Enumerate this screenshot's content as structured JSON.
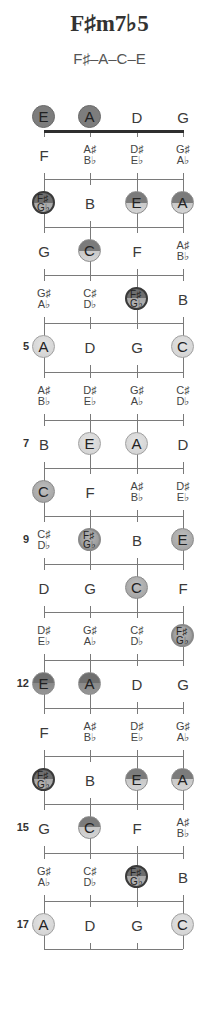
{
  "chord": {
    "name": "F♯m7♭5",
    "notes": "F♯–A–C–E"
  },
  "strings": [
    "E",
    "A",
    "D",
    "G"
  ],
  "chord_tones": [
    "F♯",
    "A",
    "C",
    "E"
  ],
  "open": [
    {
      "label": "E",
      "style": "dark"
    },
    {
      "label": "A",
      "style": "dark"
    },
    {
      "label": "D",
      "style": "plain"
    },
    {
      "label": "G",
      "style": "plain"
    }
  ],
  "fret_markers": [
    {
      "fret": 5,
      "label": "5"
    },
    {
      "fret": 7,
      "label": "7"
    },
    {
      "fret": 9,
      "label": "9"
    },
    {
      "fret": 12,
      "label": "12"
    },
    {
      "fret": 15,
      "label": "15"
    },
    {
      "fret": 17,
      "label": "17"
    }
  ],
  "frets": [
    {
      "fret": 1,
      "cells": [
        {
          "t": "F"
        },
        {
          "t": "A♯",
          "b": "B♭"
        },
        {
          "t": "D♯",
          "b": "E♭"
        },
        {
          "t": "G♯",
          "b": "A♭"
        }
      ]
    },
    {
      "fret": 2,
      "cells": [
        {
          "t": "F♯",
          "b": "G♭",
          "style": "root"
        },
        {
          "t": "B"
        },
        {
          "t": "E",
          "style": "split"
        },
        {
          "t": "A",
          "style": "split"
        }
      ]
    },
    {
      "fret": 3,
      "cells": [
        {
          "t": "G"
        },
        {
          "t": "C",
          "style": "split"
        },
        {
          "t": "F"
        },
        {
          "t": "A♯",
          "b": "B♭"
        }
      ]
    },
    {
      "fret": 4,
      "cells": [
        {
          "t": "G♯",
          "b": "A♭"
        },
        {
          "t": "C♯",
          "b": "D♭"
        },
        {
          "t": "F♯",
          "b": "G♭",
          "style": "root"
        },
        {
          "t": "B"
        }
      ]
    },
    {
      "fret": 5,
      "cells": [
        {
          "t": "A",
          "style": "light"
        },
        {
          "t": "D"
        },
        {
          "t": "G"
        },
        {
          "t": "C",
          "style": "light"
        }
      ]
    },
    {
      "fret": 6,
      "cells": [
        {
          "t": "A♯",
          "b": "B♭"
        },
        {
          "t": "D♯",
          "b": "E♭"
        },
        {
          "t": "G♯",
          "b": "A♭"
        },
        {
          "t": "C♯",
          "b": "D♭"
        }
      ]
    },
    {
      "fret": 7,
      "cells": [
        {
          "t": "B"
        },
        {
          "t": "E",
          "style": "light"
        },
        {
          "t": "A",
          "style": "light"
        },
        {
          "t": "D"
        }
      ]
    },
    {
      "fret": 8,
      "cells": [
        {
          "t": "C",
          "style": "mid"
        },
        {
          "t": "F"
        },
        {
          "t": "A♯",
          "b": "B♭"
        },
        {
          "t": "D♯",
          "b": "E♭"
        }
      ]
    },
    {
      "fret": 9,
      "cells": [
        {
          "t": "C♯",
          "b": "D♭"
        },
        {
          "t": "F♯",
          "b": "G♭",
          "style": "root mid"
        },
        {
          "t": "B"
        },
        {
          "t": "E",
          "style": "mid"
        }
      ]
    },
    {
      "fret": 10,
      "cells": [
        {
          "t": "D"
        },
        {
          "t": "G"
        },
        {
          "t": "C",
          "style": "mid"
        },
        {
          "t": "F"
        }
      ]
    },
    {
      "fret": 11,
      "cells": [
        {
          "t": "D♯",
          "b": "E♭"
        },
        {
          "t": "G♯",
          "b": "A♭"
        },
        {
          "t": "C♯",
          "b": "D♭"
        },
        {
          "t": "F♯",
          "b": "G♭",
          "style": "root mid"
        }
      ]
    },
    {
      "fret": 12,
      "cells": [
        {
          "t": "E",
          "style": "dk12"
        },
        {
          "t": "A",
          "style": "dk12"
        },
        {
          "t": "D"
        },
        {
          "t": "G"
        }
      ]
    },
    {
      "fret": 13,
      "cells": [
        {
          "t": "F"
        },
        {
          "t": "A♯",
          "b": "B♭"
        },
        {
          "t": "D♯",
          "b": "E♭"
        },
        {
          "t": "G♯",
          "b": "A♭"
        }
      ]
    },
    {
      "fret": 14,
      "cells": [
        {
          "t": "F♯",
          "b": "G♭",
          "style": "root"
        },
        {
          "t": "B"
        },
        {
          "t": "E",
          "style": "split"
        },
        {
          "t": "A",
          "style": "split"
        }
      ]
    },
    {
      "fret": 15,
      "cells": [
        {
          "t": "G"
        },
        {
          "t": "C",
          "style": "split"
        },
        {
          "t": "F"
        },
        {
          "t": "A♯",
          "b": "B♭"
        }
      ]
    },
    {
      "fret": 16,
      "cells": [
        {
          "t": "G♯",
          "b": "A♭"
        },
        {
          "t": "C♯",
          "b": "D♭"
        },
        {
          "t": "F♯",
          "b": "G♭",
          "style": "root"
        },
        {
          "t": "B"
        }
      ]
    },
    {
      "fret": 17,
      "cells": [
        {
          "t": "A",
          "style": "light"
        },
        {
          "t": "D"
        },
        {
          "t": "G"
        },
        {
          "t": "C",
          "style": "light"
        }
      ]
    }
  ]
}
